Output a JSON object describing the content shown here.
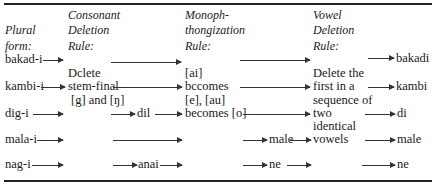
{
  "headers": {
    "plural": [
      "Plural",
      "form:"
    ],
    "consonant": [
      "Consonant",
      "Deletion",
      "Rule:"
    ],
    "monoph": [
      "Monoph-",
      "thongization",
      "Rule:"
    ],
    "vowel": [
      "Vowel",
      "Deletion",
      "Rule:"
    ]
  },
  "rules": {
    "consonant": [
      "Dclete",
      "stem-final",
      "[g] and [ŋ]"
    ],
    "monoph": [
      "[ai]",
      "bccomes",
      "[e], [au]",
      "becomes [o]"
    ],
    "vowel": [
      "Delete the",
      "first in a",
      "sequence of",
      "two",
      "identical",
      "vowels"
    ]
  },
  "rows": [
    {
      "plural": "bakad-i",
      "after_consonant": "",
      "after_monoph": "",
      "result": "bakadi"
    },
    {
      "plural": "kambi-i",
      "after_consonant": "",
      "after_monoph": "",
      "result": "kambi"
    },
    {
      "plural": "dig-i",
      "after_consonant": "dil",
      "after_monoph": "",
      "result": "di"
    },
    {
      "plural": "mala-i",
      "after_consonant": "",
      "after_monoph": "male",
      "result": "male"
    },
    {
      "plural": "nag-i",
      "after_consonant": "anai",
      "after_monoph": "ne",
      "result": "ne"
    }
  ]
}
